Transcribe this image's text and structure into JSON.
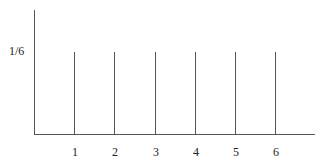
{
  "chart_data": {
    "type": "bar",
    "title": "",
    "xlabel": "",
    "ylabel": "",
    "categories": [
      "1",
      "2",
      "3",
      "4",
      "5",
      "6"
    ],
    "values": [
      0.1667,
      0.1667,
      0.1667,
      0.1667,
      0.1667,
      0.1667
    ],
    "value_labels": [
      "1/6",
      "1/6",
      "1/6",
      "1/6",
      "1/6",
      "1/6"
    ],
    "y_ticks": [
      "1/6"
    ],
    "ylim": [
      0,
      0.25
    ],
    "grid": false,
    "legend": null,
    "style": "stem"
  },
  "labels": {
    "y_tick": "1/6",
    "x_ticks": [
      "1",
      "2",
      "3",
      "4",
      "5",
      "6"
    ]
  }
}
